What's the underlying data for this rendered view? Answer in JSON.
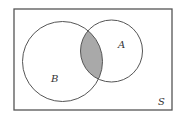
{
  "diagram": {
    "type": "venn",
    "universe": {
      "label": "S",
      "x": 14,
      "y": 9,
      "width": 158,
      "height": 101
    },
    "sets": [
      {
        "label": "A",
        "cx": 111.5,
        "cy": 51,
        "r": 31,
        "label_x": 118,
        "label_y": 48
      },
      {
        "label": "B",
        "cx": 62.5,
        "cy": 61.5,
        "r": 40,
        "label_x": 51,
        "label_y": 82
      }
    ],
    "shaded_region": "A ∩ B",
    "colors": {
      "stroke": "#555555",
      "shade": "#a9a9a9",
      "background": "#ffffff"
    },
    "universe_label_pos": {
      "x": 158,
      "y": 105
    }
  }
}
